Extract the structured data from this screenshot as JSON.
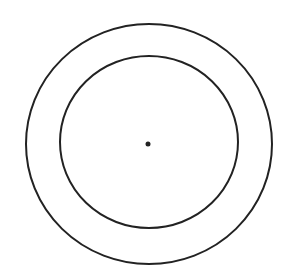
{
  "diagram": {
    "type": "concentric-circles",
    "background": "#ffffff",
    "stroke_color": "#222222",
    "center": {
      "cx": 149,
      "cy": 144
    },
    "outer_circle": {
      "rx": 123,
      "ry": 120,
      "stroke_width": 2
    },
    "inner_circle": {
      "rx": 89,
      "ry": 86,
      "stroke_width": 2
    },
    "center_dot": {
      "r": 2.5
    }
  }
}
